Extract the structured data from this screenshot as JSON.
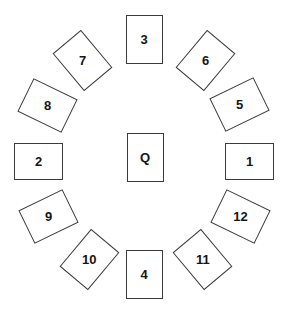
{
  "diagram": {
    "canvas": {
      "width": 286,
      "height": 314,
      "background": "#ffffff"
    },
    "card_style": {
      "width": 37,
      "height": 49,
      "fill": "#ffffff",
      "border_color": "#3b3b3b",
      "border_width": 1.6,
      "text_color": "#151515",
      "font_weight": "bold",
      "font_size": 13
    },
    "center_card": {
      "id": "center-card-q",
      "label": "Q",
      "cx": 145,
      "cy": 157,
      "rotation": 0
    },
    "ring_cards": [
      {
        "id": "card-1",
        "label": "1",
        "cx": 249,
        "cy": 161,
        "rotation": 90,
        "clock_position": 3
      },
      {
        "id": "card-2",
        "label": "2",
        "cx": 38,
        "cy": 161,
        "rotation": 90,
        "clock_position": 9
      },
      {
        "id": "card-3",
        "label": "3",
        "cx": 144,
        "cy": 39,
        "rotation": 0,
        "clock_position": 12
      },
      {
        "id": "card-4",
        "label": "4",
        "cx": 144,
        "cy": 274,
        "rotation": 0,
        "clock_position": 6
      },
      {
        "id": "card-5",
        "label": "5",
        "cx": 239,
        "cy": 104,
        "rotation": 64,
        "clock_position": 2
      },
      {
        "id": "card-6",
        "label": "6",
        "cx": 205,
        "cy": 60,
        "rotation": 40,
        "clock_position": 1
      },
      {
        "id": "card-7",
        "label": "7",
        "cx": 82,
        "cy": 60,
        "rotation": -40,
        "clock_position": 11
      },
      {
        "id": "card-8",
        "label": "8",
        "cx": 47,
        "cy": 105,
        "rotation": -64,
        "clock_position": 10
      },
      {
        "id": "card-9",
        "label": "9",
        "cx": 48,
        "cy": 216,
        "rotation": 64,
        "clock_position": 8
      },
      {
        "id": "card-10",
        "label": "10",
        "cx": 89,
        "cy": 259,
        "rotation": 40,
        "clock_position": 7
      },
      {
        "id": "card-11",
        "label": "11",
        "cx": 202,
        "cy": 259,
        "rotation": -40,
        "clock_position": 5
      },
      {
        "id": "card-12",
        "label": "12",
        "cx": 240,
        "cy": 216,
        "rotation": -64,
        "clock_position": 4
      }
    ]
  }
}
